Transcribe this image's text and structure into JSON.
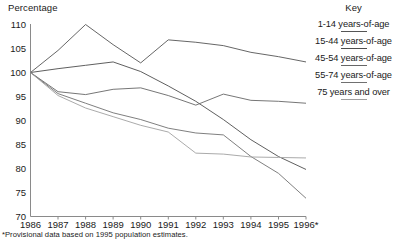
{
  "chart_data": {
    "type": "line",
    "title": "",
    "ylabel": "Percentage",
    "xlabel": "",
    "ylim": [
      70,
      110
    ],
    "ytick_labels": [
      "110",
      "105",
      "100",
      "95",
      "90",
      "85",
      "80",
      "75",
      "70"
    ],
    "ytick_values": [
      110,
      105,
      100,
      95,
      90,
      85,
      80,
      75,
      70
    ],
    "grid": false,
    "legend_position": "right",
    "legend_title": "Key",
    "categories": [
      "1986",
      "1987",
      "1988",
      "1989",
      "1990",
      "1991",
      "1992",
      "1993",
      "1994",
      "1995",
      "1996*"
    ],
    "x": [
      1986,
      1987,
      1988,
      1989,
      1990,
      1991,
      1992,
      1993,
      1994,
      1995,
      1996
    ],
    "series": [
      {
        "name": "1-14 years-of-age",
        "color": "#555555",
        "values": [
          100.0,
          104.6,
          110.0,
          105.8,
          102.0,
          106.8,
          106.3,
          105.6,
          104.2,
          103.3,
          102.2
        ]
      },
      {
        "name": "15-44 years-of-age",
        "color": "#4d4d4d",
        "values": [
          100.0,
          100.8,
          101.5,
          102.2,
          100.2,
          97.2,
          94.0,
          90.2,
          86.0,
          82.5,
          79.8
        ]
      },
      {
        "name": "45-54 years-of-age",
        "color": "#666666",
        "values": [
          100.0,
          96.0,
          95.4,
          96.5,
          96.8,
          95.2,
          93.2,
          95.5,
          94.2,
          94.0,
          93.6
        ]
      },
      {
        "name": "55-74 years-of-age",
        "color": "#707070",
        "values": [
          100.0,
          95.6,
          93.6,
          91.6,
          90.2,
          88.4,
          87.4,
          87.0,
          82.5,
          79.0,
          73.8
        ]
      },
      {
        "name": "75 years and over",
        "color": "#a0a0a0",
        "values": [
          100.0,
          95.2,
          92.6,
          90.8,
          89.0,
          87.6,
          83.2,
          83.0,
          82.4,
          82.3,
          82.2
        ]
      }
    ],
    "footnote": "*Provisional data based on 1995 population estimates."
  },
  "axis": {
    "y_title": "Percentage"
  },
  "legend": {
    "title": "Key",
    "entries": [
      {
        "label": "1-14 years-of-age"
      },
      {
        "label": "15-44 years-of-age"
      },
      {
        "label": "45-54 years-of-age"
      },
      {
        "label": "55-74 years-of-age"
      },
      {
        "label": "75 years and over"
      }
    ]
  },
  "colors": {
    "axis": "#8a8a8a",
    "text": "#1a1a1a"
  }
}
